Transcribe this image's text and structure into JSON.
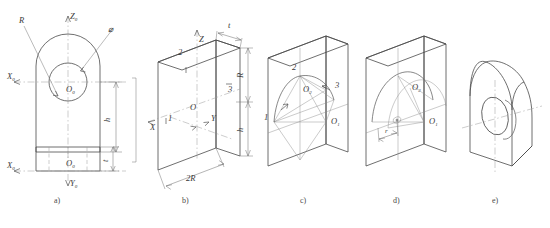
{
  "figure": {
    "caption": "",
    "background": "#ffffff",
    "line_color": "#4a4a4a",
    "center_line_color": "#9a9a9a"
  },
  "panels": [
    {
      "id": "a",
      "label": "a)",
      "description": "Orthographic views: front view of arch-top block with circular hole, and bottom view",
      "annotations": [
        {
          "name": "radius-leader",
          "text": "R"
        },
        {
          "name": "diameter-leader",
          "text": "⌀"
        },
        {
          "name": "axis-z0-prime",
          "text": "Z",
          "subscript": "0"
        },
        {
          "name": "axis-x0-prime",
          "text": "X",
          "subscript": "0"
        },
        {
          "name": "origin-o0-prime",
          "text": "O",
          "subscript": "0"
        },
        {
          "name": "height-dim-h",
          "text": "h"
        },
        {
          "name": "axis-x0",
          "text": "X",
          "subscript": "0"
        },
        {
          "name": "origin-o0",
          "text": "O",
          "subscript": "0"
        },
        {
          "name": "axis-y0",
          "text": "Y",
          "subscript": "0"
        },
        {
          "name": "thickness-dim-t",
          "text": "t"
        }
      ]
    },
    {
      "id": "b",
      "label": "b)",
      "description": "Isometric axes and bounding box of the block",
      "annotations": [
        {
          "name": "axis-x",
          "text": "X"
        },
        {
          "name": "axis-y",
          "text": "Y"
        },
        {
          "name": "axis-z",
          "text": "Z"
        },
        {
          "name": "origin-o",
          "text": "O"
        },
        {
          "name": "point-1",
          "text": "1"
        },
        {
          "name": "point-2",
          "text": "2"
        },
        {
          "name": "point-3",
          "text": "3"
        },
        {
          "name": "thickness-dim-t",
          "text": "t"
        },
        {
          "name": "radius-dim-r",
          "text": "R"
        },
        {
          "name": "height-dim-h",
          "text": "h"
        },
        {
          "name": "width-dim-2r",
          "text": "2R"
        }
      ]
    },
    {
      "id": "c",
      "label": "c)",
      "description": "Four-centre ellipse construction for the arch on the front face",
      "annotations": [
        {
          "name": "point-1",
          "text": "1"
        },
        {
          "name": "point-2",
          "text": "2"
        },
        {
          "name": "point-3",
          "text": "3"
        },
        {
          "name": "centre-o2",
          "text": "O",
          "subscript": "2"
        },
        {
          "name": "centre-o1",
          "text": "O",
          "subscript": "1"
        }
      ]
    },
    {
      "id": "d",
      "label": "d)",
      "description": "Arc transfer to the rear face and hole ellipse laid out",
      "annotations": [
        {
          "name": "centre-o2",
          "text": "O",
          "subscript": "2"
        },
        {
          "name": "centre-o1",
          "text": "O",
          "subscript": "1"
        },
        {
          "name": "hole-radius-dim-r",
          "text": "r"
        }
      ]
    },
    {
      "id": "e",
      "label": "e)",
      "description": "Finished isometric solid with through hole, outlines darkened",
      "annotations": []
    }
  ]
}
